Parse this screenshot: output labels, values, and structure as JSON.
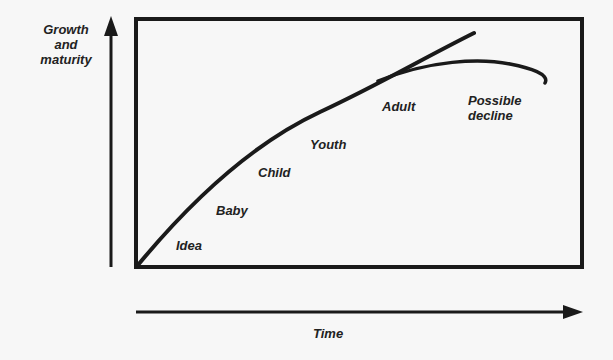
{
  "diagram": {
    "y_axis_label_lines": [
      "Growth",
      "and",
      "maturity"
    ],
    "x_axis_label": "Time",
    "stages": {
      "idea": "Idea",
      "baby": "Baby",
      "child": "Child",
      "youth": "Youth",
      "adult": "Adult",
      "decline_line1": "Possible",
      "decline_line2": "decline"
    },
    "curves": [
      {
        "name": "continued-growth",
        "description": "Rising curve continuing upward"
      },
      {
        "name": "possible-decline",
        "description": "Branch that plateaus and declines"
      }
    ],
    "colors": {
      "line": "#1a1a1a",
      "background": "#f7f7f7"
    }
  }
}
